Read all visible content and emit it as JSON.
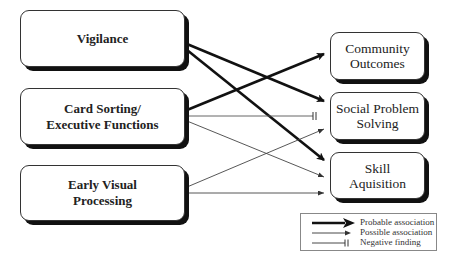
{
  "diagram": {
    "sources": [
      {
        "id": "vigilance",
        "label_lines": [
          "Vigilance"
        ]
      },
      {
        "id": "card_sorting",
        "label_lines": [
          "Card Sorting/",
          "Executive Functions"
        ]
      },
      {
        "id": "early_visual",
        "label_lines": [
          "Early Visual",
          "Processing"
        ]
      }
    ],
    "targets": [
      {
        "id": "community",
        "label_lines": [
          "Community",
          "Outcomes"
        ]
      },
      {
        "id": "social",
        "label_lines": [
          "Social Problem",
          "Solving"
        ]
      },
      {
        "id": "skill",
        "label_lines": [
          "Skill",
          "Aquisition"
        ]
      }
    ],
    "edges": [
      {
        "from": "vigilance",
        "to": "social",
        "type": "probable"
      },
      {
        "from": "vigilance",
        "to": "skill",
        "type": "probable"
      },
      {
        "from": "card_sorting",
        "to": "community",
        "type": "probable"
      },
      {
        "from": "card_sorting",
        "to": "social",
        "type": "negative"
      },
      {
        "from": "card_sorting",
        "to": "skill",
        "type": "possible"
      },
      {
        "from": "early_visual",
        "to": "social",
        "type": "possible"
      },
      {
        "from": "early_visual",
        "to": "skill",
        "type": "possible"
      }
    ]
  },
  "legend": {
    "items": [
      {
        "type": "probable",
        "label": "Probable association"
      },
      {
        "type": "possible",
        "label": "Possible association"
      },
      {
        "type": "negative",
        "label": "Negative finding"
      }
    ]
  },
  "colors": {
    "line": "#111111",
    "thin_line": "#444444",
    "box_border": "#333333",
    "shadow": "#111111"
  }
}
